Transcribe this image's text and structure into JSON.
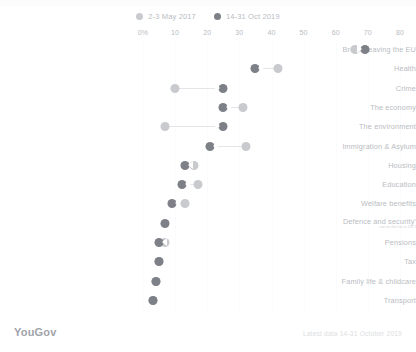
{
  "chart_data": {
    "type": "dumbbell",
    "title": "",
    "xlabel": "",
    "ylabel": "",
    "xlim": [
      0,
      80
    ],
    "grid": true,
    "legend_position": "top-center",
    "tick_labels": [
      "0%",
      "10",
      "20",
      "30",
      "40",
      "50",
      "60",
      "70",
      "80"
    ],
    "tick_values": [
      0,
      10,
      20,
      30,
      40,
      50,
      60,
      70,
      80
    ],
    "series": [
      {
        "name": "2-3 May 2017",
        "color": "#c8cacd",
        "values": [
          66,
          42,
          10,
          31,
          7,
          32,
          16,
          17,
          13,
          null,
          7,
          5,
          4,
          3
        ]
      },
      {
        "name": "14-31 Oct 2019",
        "color": "#7d8086",
        "values": [
          69,
          35,
          25,
          25,
          25,
          21,
          13,
          12,
          9,
          7,
          5,
          5,
          4,
          3
        ]
      }
    ],
    "categories": [
      "Britain leaving the EU",
      "Health",
      "Crime",
      "The economy",
      "The environment",
      "Immigration & Asylum",
      "Housing",
      "Education",
      "Welfare benefits",
      "Defence and security'",
      "Pensions",
      "Tax",
      "Family life & childcare",
      "Transport"
    ],
    "category_notes": [
      "",
      "",
      "",
      "",
      "",
      "",
      "",
      "",
      "",
      "not on the list in 2017",
      "",
      "",
      "",
      ""
    ]
  },
  "legend": {
    "items": [
      {
        "label": "2-3 May 2017",
        "color": "#c8cacd"
      },
      {
        "label": "14-31 Oct 2019",
        "color": "#7d8086"
      }
    ]
  },
  "footer": {
    "brand": "YouGov",
    "source": "Latest data 14-31 October 2019"
  },
  "colors": {
    "series_old": "#c8cacd",
    "series_new": "#7d8086",
    "text": "#b9bcc2",
    "grid": "#fafbfc",
    "background": "#ffffff"
  }
}
